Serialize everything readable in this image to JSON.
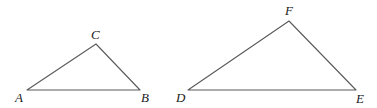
{
  "diagram": {
    "type": "similar-triangles",
    "stroke_color": "#5a5a5a",
    "label_color": "#222222",
    "triangles": [
      {
        "name": "ABC",
        "vertices": {
          "A": {
            "x": 27,
            "y": 90
          },
          "B": {
            "x": 140,
            "y": 90
          },
          "C": {
            "x": 96,
            "y": 44
          }
        },
        "labels": {
          "A": {
            "text": "A",
            "x": 15,
            "y": 102
          },
          "B": {
            "text": "B",
            "x": 141,
            "y": 102
          },
          "C": {
            "text": "C",
            "x": 91,
            "y": 39
          }
        }
      },
      {
        "name": "DEF",
        "vertices": {
          "D": {
            "x": 188,
            "y": 90
          },
          "E": {
            "x": 356,
            "y": 90
          },
          "F": {
            "x": 289,
            "y": 21
          }
        },
        "labels": {
          "D": {
            "text": "D",
            "x": 176,
            "y": 102
          },
          "E": {
            "text": "E",
            "x": 356,
            "y": 103
          },
          "F": {
            "text": "F",
            "x": 285,
            "y": 15
          }
        }
      }
    ]
  }
}
